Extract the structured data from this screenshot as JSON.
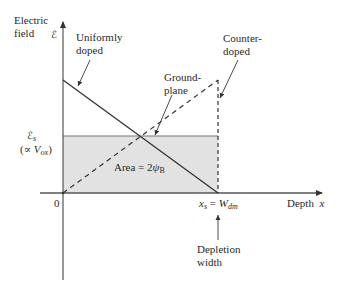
{
  "diagram": {
    "y_axis_label_line1": "Electric",
    "y_axis_label_line2": "field",
    "y_axis_symbol": "ℰ",
    "x_axis_label": "Depth",
    "x_axis_symbol": "x",
    "origin_label": "0",
    "es_label": "ℰ",
    "es_sub": "s",
    "es_prop_prefix": "(∝ ",
    "es_prop_var": "V",
    "es_prop_sub": "ox",
    "es_prop_suffix": ")",
    "area_label_prefix": "Area = 2",
    "area_psi": "ψ",
    "area_sub": "B",
    "xs_label": "x",
    "xs_sub": "s",
    "xs_eq": " = ",
    "wdm_label": "W",
    "wdm_sub": "dm",
    "annotations": {
      "uniformly_doped_1": "Uniformly",
      "uniformly_doped_2": "doped",
      "ground_plane_1": "Ground-",
      "ground_plane_2": "plane",
      "counter_doped_1": "Counter-",
      "counter_doped_2": "doped",
      "depletion_width_1": "Depletion",
      "depletion_width_2": "width"
    },
    "colors": {
      "axis": "#555555",
      "line": "#333333",
      "shade": "#e2e2e2",
      "shade_border": "#777777"
    }
  }
}
